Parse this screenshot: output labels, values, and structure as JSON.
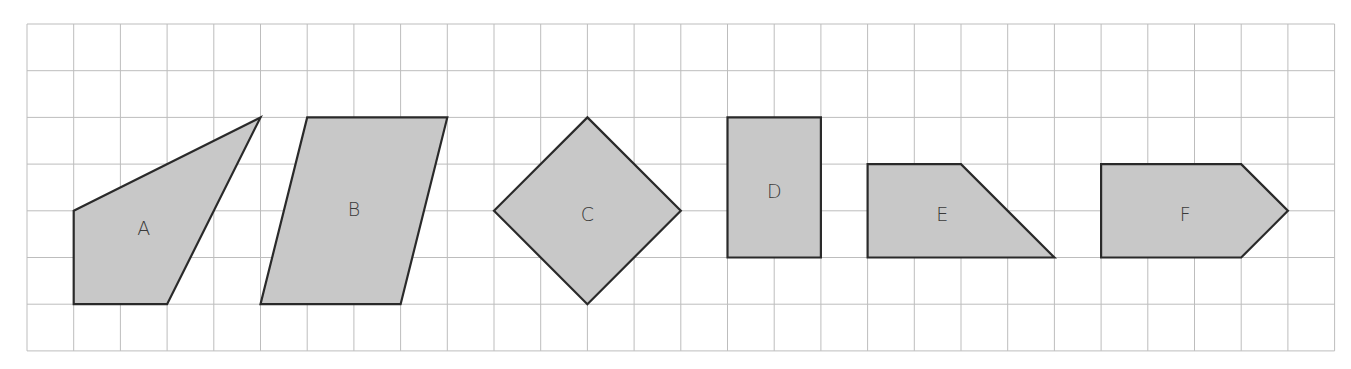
{
  "diagram": {
    "grid": {
      "cols": 28,
      "rows": 7,
      "cell_px": 46.7,
      "origin_px": [
        27,
        24
      ],
      "line_color": "#bdbdbd",
      "background": "#ffffff"
    },
    "style": {
      "fill": "#c8c8c8",
      "stroke": "#2a2a2a",
      "label_color": "#3a3a3a"
    },
    "shapes": [
      {
        "label": "A",
        "vertices": [
          [
            1,
            4
          ],
          [
            5,
            2
          ],
          [
            3,
            6
          ],
          [
            1,
            6
          ]
        ],
        "label_pos": [
          2.5,
          4.4
        ]
      },
      {
        "label": "B",
        "vertices": [
          [
            6,
            2
          ],
          [
            9,
            2
          ],
          [
            8,
            6
          ],
          [
            5,
            6
          ]
        ],
        "label_pos": [
          7.0,
          4.0
        ]
      },
      {
        "label": "C",
        "vertices": [
          [
            12,
            2
          ],
          [
            14,
            4
          ],
          [
            12,
            6
          ],
          [
            10,
            4
          ]
        ],
        "label_pos": [
          12.0,
          4.1
        ]
      },
      {
        "label": "D",
        "vertices": [
          [
            15,
            2
          ],
          [
            17,
            2
          ],
          [
            17,
            5
          ],
          [
            15,
            5
          ]
        ],
        "label_pos": [
          16.0,
          3.6
        ]
      },
      {
        "label": "E",
        "vertices": [
          [
            18,
            3
          ],
          [
            20,
            3
          ],
          [
            22,
            5
          ],
          [
            18,
            5
          ]
        ],
        "label_pos": [
          19.6,
          4.1
        ]
      },
      {
        "label": "F",
        "vertices": [
          [
            23,
            3
          ],
          [
            26,
            3
          ],
          [
            27,
            4
          ],
          [
            26,
            5
          ],
          [
            23,
            5
          ]
        ],
        "label_pos": [
          24.8,
          4.1
        ]
      }
    ]
  }
}
